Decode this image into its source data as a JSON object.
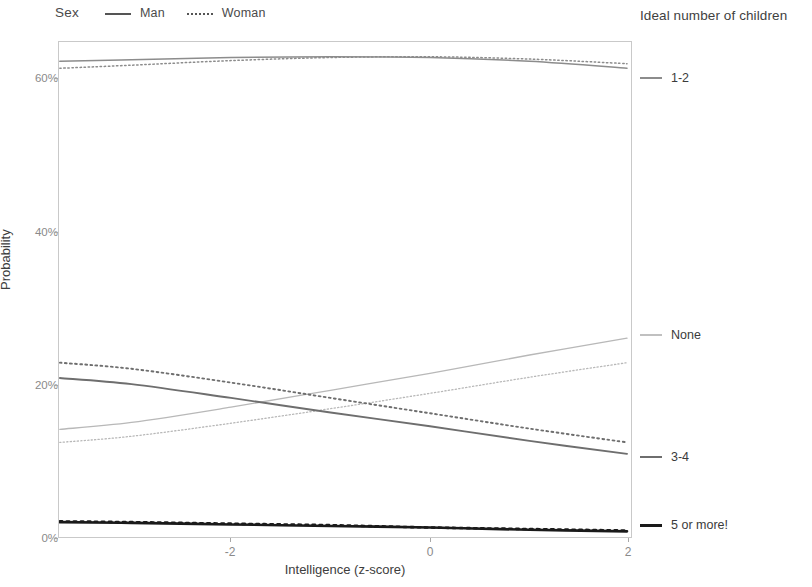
{
  "legend": {
    "title": "Sex",
    "items": [
      {
        "label": "Man",
        "style": "solid"
      },
      {
        "label": "Woman",
        "style": "dotted"
      }
    ]
  },
  "right_legend_title": "Ideal number of children",
  "axes": {
    "x_title": "Intelligence (z-score)",
    "y_title": "Probability",
    "x_ticks": [
      "-2",
      "0",
      "2"
    ],
    "y_ticks": [
      "0%",
      "20%",
      "40%",
      "60%"
    ]
  },
  "direct_labels": [
    {
      "label": "1-2",
      "color": "#8c8c8c"
    },
    {
      "label": "None",
      "color": "#b8b8b8"
    },
    {
      "label": "3-4",
      "color": "#6e6e6e"
    },
    {
      "label": "5 or more!",
      "color": "#1a1a1a"
    }
  ],
  "chart_data": {
    "type": "line",
    "title": "",
    "xlabel": "Intelligence (z-score)",
    "ylabel": "Probability",
    "xlim": [
      -3.72,
      1.98
    ],
    "ylim": [
      -0.02,
      0.65
    ],
    "x_ticks": [
      -2,
      0,
      2
    ],
    "y_ticks": [
      0,
      20,
      40,
      60
    ],
    "y_tick_labels": [
      "0%",
      "20%",
      "40%",
      "60%"
    ],
    "grid": false,
    "legend_position": "top-left (Sex) and right (Ideal number of children)",
    "color_by": "Ideal number of children",
    "linetype_by": "Sex",
    "colors": {
      "None": "#b8b8b8",
      "1-2": "#8c8c8c",
      "3-4": "#6e6e6e",
      "5 or more!": "#1a1a1a"
    },
    "x": [
      -3.72,
      -3.0,
      -2.0,
      -1.0,
      0.0,
      1.0,
      1.98
    ],
    "series": [
      {
        "name": "1-2 / Man",
        "category": "1-2",
        "sex": "Man",
        "linetype": "solid",
        "values": [
          62.3,
          62.5,
          62.8,
          62.9,
          62.8,
          62.3,
          61.4
        ]
      },
      {
        "name": "1-2 / Woman",
        "category": "1-2",
        "sex": "Woman",
        "linetype": "dotted",
        "values": [
          61.4,
          61.8,
          62.4,
          62.8,
          62.9,
          62.6,
          62.0
        ]
      },
      {
        "name": "3-4 / Man",
        "category": "3-4",
        "sex": "Man",
        "linetype": "solid",
        "values": [
          21.0,
          20.2,
          18.4,
          16.5,
          14.7,
          12.8,
          11.1
        ]
      },
      {
        "name": "3-4 / Woman",
        "category": "3-4",
        "sex": "Woman",
        "linetype": "dotted",
        "values": [
          23.0,
          22.2,
          20.4,
          18.4,
          16.4,
          14.4,
          12.6
        ]
      },
      {
        "name": "None / Man",
        "category": "None",
        "sex": "Man",
        "linetype": "solid",
        "values": [
          14.3,
          15.2,
          17.2,
          19.4,
          21.6,
          24.0,
          26.2
        ]
      },
      {
        "name": "None / Woman",
        "category": "None",
        "sex": "Woman",
        "linetype": "dotted",
        "values": [
          12.6,
          13.4,
          15.1,
          17.0,
          19.0,
          21.1,
          23.0
        ]
      },
      {
        "name": "5 or more! / Man",
        "category": "5 or more!",
        "sex": "Man",
        "linetype": "solid",
        "values": [
          2.2,
          2.1,
          1.9,
          1.7,
          1.5,
          1.2,
          1.0
        ]
      },
      {
        "name": "5 or more! / Woman",
        "category": "5 or more!",
        "sex": "Woman",
        "linetype": "dotted",
        "values": [
          2.3,
          2.2,
          2.0,
          1.8,
          1.5,
          1.3,
          1.1
        ]
      }
    ]
  }
}
